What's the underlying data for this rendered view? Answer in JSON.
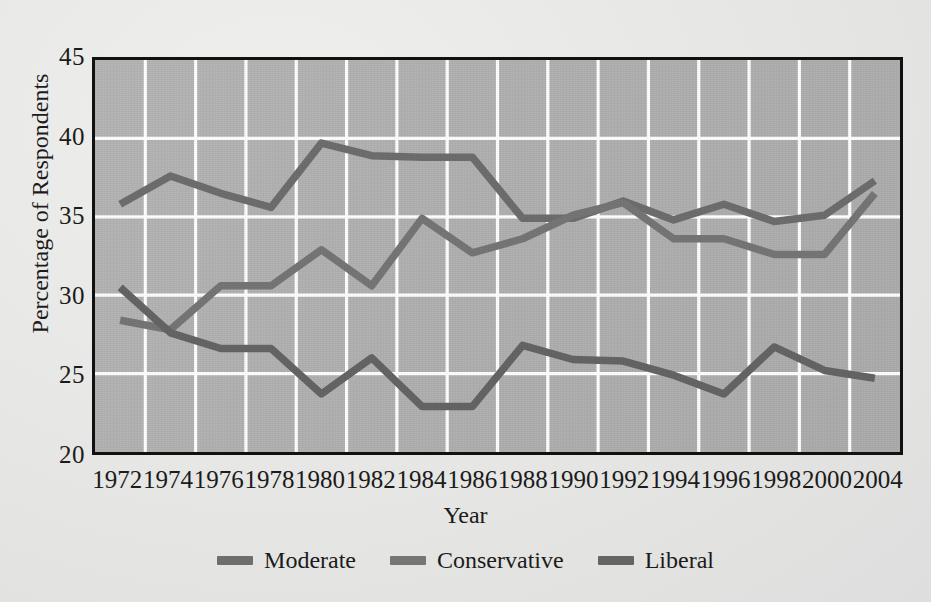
{
  "chart_data": {
    "type": "line",
    "title": "",
    "xlabel": "Year",
    "ylabel": "Percentage of Respondents",
    "ylim": [
      20,
      45
    ],
    "yticks": [
      20,
      25,
      30,
      35,
      40,
      45
    ],
    "grid": true,
    "legend_position": "bottom-center",
    "categories": [
      "1972",
      "1974",
      "1976",
      "1978",
      "1980",
      "1982",
      "1984",
      "1986",
      "1988",
      "1990",
      "1992",
      "1994",
      "1996",
      "1998",
      "2000",
      "2004"
    ],
    "x": [
      1972,
      1974,
      1976,
      1978,
      1980,
      1982,
      1984,
      1986,
      1988,
      1990,
      1992,
      1994,
      1996,
      1998,
      2000,
      2004
    ],
    "series": [
      {
        "name": "Moderate",
        "color": "#6e6e6e",
        "values": [
          35.8,
          37.6,
          36.5,
          35.6,
          39.7,
          38.9,
          38.8,
          38.8,
          34.9,
          34.9,
          36.0,
          34.8,
          35.8,
          34.7,
          35.1,
          37.3
        ]
      },
      {
        "name": "Conservative",
        "color": "#767676",
        "values": [
          28.4,
          27.8,
          30.6,
          30.6,
          32.9,
          30.6,
          34.9,
          32.7,
          33.6,
          35.1,
          35.9,
          33.6,
          33.6,
          32.6,
          32.6,
          36.5
        ]
      },
      {
        "name": "Liberal",
        "color": "#656565",
        "values": [
          30.5,
          27.6,
          26.6,
          26.6,
          23.7,
          26.0,
          22.9,
          22.9,
          26.8,
          25.9,
          25.8,
          24.9,
          23.7,
          26.7,
          25.2,
          24.7
        ]
      }
    ]
  },
  "legend": {
    "items": [
      {
        "label": "Moderate"
      },
      {
        "label": "Conservative"
      },
      {
        "label": "Liberal"
      }
    ]
  },
  "axes": {
    "x_title": "Year",
    "y_title": "Percentage of Respondents"
  },
  "colors": {
    "plot_background": "#b2b2b2",
    "figure_background": "#e7e7e5",
    "gridline": "#ffffff",
    "frame": "#111111",
    "text": "#1b1b1b"
  }
}
